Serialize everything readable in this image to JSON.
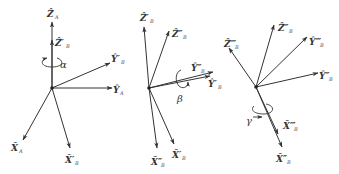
{
  "colors": {
    "line": "#333333",
    "background": "#ffffff"
  },
  "frames": [
    {
      "name": "frame-1",
      "origin": [
        52,
        88
      ],
      "rotation": {
        "symbol": "α",
        "about": "Z"
      },
      "axes": [
        {
          "id": "ZA",
          "tip": [
            52,
            22
          ],
          "label": "Z",
          "sub": "A",
          "lx": 46,
          "ly": 16
        },
        {
          "id": "ZB1",
          "tip": [
            52,
            40
          ],
          "label": "Z",
          "sub": "B",
          "prime": "′",
          "lx": 55,
          "ly": 44
        },
        {
          "id": "YB1",
          "tip": [
            110,
            63
          ],
          "label": "Y",
          "sub": "B",
          "prime": "′",
          "lx": 112,
          "ly": 61
        },
        {
          "id": "YA",
          "tip": [
            112,
            88
          ],
          "label": "Y",
          "sub": "A",
          "lx": 113,
          "ly": 92
        },
        {
          "id": "XA",
          "tip": [
            23,
            140
          ],
          "label": "X",
          "sub": "A",
          "lx": 12,
          "ly": 150
        },
        {
          "id": "XB1",
          "tip": [
            70,
            148
          ],
          "label": "X",
          "sub": "B",
          "prime": "′",
          "lx": 66,
          "ly": 162
        }
      ]
    },
    {
      "name": "frame-2",
      "origin": [
        149,
        88
      ],
      "rotation": {
        "symbol": "β",
        "about": "Y"
      },
      "axes": [
        {
          "id": "ZB1",
          "tip": [
            144,
            27
          ],
          "label": "Z",
          "sub": "B",
          "prime": "′",
          "lx": 140,
          "ly": 21
        },
        {
          "id": "ZB2",
          "tip": [
            169,
            31
          ],
          "label": "Z",
          "sub": "B",
          "prime": "″",
          "lx": 172,
          "ly": 36
        },
        {
          "id": "YB2",
          "tip": [
            213,
            72
          ],
          "label": "Y",
          "sub": "B",
          "prime": "″",
          "lx": 191,
          "ly": 70
        },
        {
          "id": "YB1",
          "tip": [
            210,
            76
          ],
          "label": "Y",
          "sub": "B",
          "prime": "′",
          "lx": 208,
          "ly": 86
        },
        {
          "id": "XB2",
          "tip": [
            157,
            148
          ],
          "label": "X",
          "sub": "B",
          "prime": "″",
          "lx": 151,
          "ly": 164
        },
        {
          "id": "XB1",
          "tip": [
            174,
            144
          ],
          "label": "X",
          "sub": "B",
          "prime": "′",
          "lx": 172,
          "ly": 157
        }
      ]
    },
    {
      "name": "frame-3",
      "origin": [
        256,
        87
      ],
      "rotation": {
        "symbol": "γ",
        "about": "X"
      },
      "axes": [
        {
          "id": "ZB2",
          "tip": [
            274,
            25
          ],
          "label": "Z",
          "sub": "B",
          "prime": "″",
          "lx": 278,
          "ly": 31
        },
        {
          "id": "ZB3",
          "tip": [
            229,
            48
          ],
          "label": "Z",
          "sub": "B",
          "prime": "‴",
          "lx": 224,
          "ly": 46
        },
        {
          "id": "YB3",
          "tip": [
            307,
            37
          ],
          "label": "Y",
          "sub": "B",
          "prime": "‴",
          "lx": 309,
          "ly": 44
        },
        {
          "id": "YB2",
          "tip": [
            318,
            73
          ],
          "label": "Y",
          "sub": "B",
          "prime": "″",
          "lx": 319,
          "ly": 78
        },
        {
          "id": "XB3",
          "tip": [
            278,
            134
          ],
          "label": "X",
          "sub": "B",
          "prime": "‴",
          "lx": 283,
          "ly": 128
        },
        {
          "id": "XB2",
          "tip": [
            282,
            147
          ],
          "label": "X",
          "sub": "B",
          "prime": "″",
          "lx": 276,
          "ly": 161
        }
      ]
    }
  ],
  "labels": {
    "f1": {
      "ZA": "Ẑ",
      "ZA_sub": "A",
      "ZB": "Ẑ′",
      "ZB_sub": "B",
      "YB": "Ŷ′",
      "YB_sub": "B",
      "YA": "Ŷ",
      "YA_sub": "A",
      "XA": "X̂",
      "XA_sub": "A",
      "XB": "X̂′",
      "XB_sub": "B",
      "rot": "α"
    },
    "f2": {
      "ZB1": "Ẑ′",
      "ZB1_sub": "B",
      "ZB2": "Ẑ″",
      "ZB2_sub": "B",
      "YB2": "Ŷ″",
      "YB2_sub": "B",
      "YB1": "Ŷ′",
      "YB1_sub": "B",
      "XB2": "X̂″",
      "XB2_sub": "B",
      "XB1": "X̂′",
      "XB1_sub": "B",
      "rot": "β"
    },
    "f3": {
      "ZB2": "Ẑ″",
      "ZB2_sub": "B",
      "ZB3": "Ẑ‴",
      "ZB3_sub": "B",
      "YB3": "Ŷ‴",
      "YB3_sub": "B",
      "YB2": "Ŷ″",
      "YB2_sub": "B",
      "XB3": "X̂‴",
      "XB3_sub": "B",
      "XB2": "X̂″",
      "XB2_sub": "B",
      "rot": "γ"
    }
  }
}
